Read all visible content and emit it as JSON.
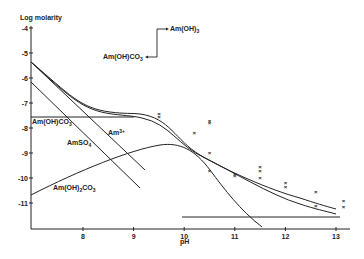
{
  "chart_data": {
    "type": "line",
    "title": "",
    "xlabel": "pH",
    "ylabel": "Log molarity",
    "xlim": [
      7.0,
      13.3
    ],
    "ylim": [
      -12.0,
      -4.0
    ],
    "xticks": [
      "8",
      "9",
      "10",
      "11",
      "12",
      "13"
    ],
    "yticks": [
      "-4",
      "-5",
      "-6",
      "-7",
      "-8",
      "-9",
      "-10",
      "-11"
    ],
    "grid": false,
    "legend": "none (inline labels)",
    "series": [
      {
        "name": "Total solubility (upper)",
        "x": [
          7.0,
          7.5,
          8.0,
          8.5,
          9.0,
          9.5,
          10.0,
          10.5,
          11.0,
          11.5,
          12.0,
          12.5,
          13.0
        ],
        "y": [
          -5.4,
          -6.2,
          -7.0,
          -7.4,
          -7.55,
          -7.8,
          -8.5,
          -9.1,
          -9.6,
          -10.0,
          -10.4,
          -10.7,
          -11.05
        ]
      },
      {
        "name": "Total solubility (lower)",
        "x": [
          7.0,
          7.5,
          8.0,
          8.5,
          9.0,
          9.5,
          10.0,
          10.5,
          11.0,
          11.5,
          12.0,
          12.5,
          13.0
        ],
        "y": [
          -5.4,
          -6.25,
          -7.05,
          -7.5,
          -7.6,
          -7.95,
          -8.7,
          -9.3,
          -9.7,
          -10.05,
          -10.5,
          -10.85,
          -11.2
        ]
      },
      {
        "name": "Am(OH)CO3 (solid, horizontal)",
        "x": [
          7.0,
          9.0
        ],
        "y": [
          -7.55,
          -7.55
        ]
      },
      {
        "name": "Am3+",
        "x": [
          7.0,
          9.0
        ],
        "y": [
          -5.4,
          -9.6
        ]
      },
      {
        "name": "AmSO4+",
        "x": [
          7.0,
          9.0
        ],
        "y": [
          -6.2,
          -10.3
        ]
      },
      {
        "name": "Am(OH)2CO3-",
        "x": [
          7.0,
          8.0,
          9.0,
          9.5,
          10.0,
          10.5,
          11.0,
          11.5
        ],
        "y": [
          -10.6,
          -9.6,
          -8.75,
          -8.5,
          -8.7,
          -9.6,
          -10.7,
          -12.0
        ]
      },
      {
        "name": "Am(OH)3 (solid, horizontal)",
        "x": [
          10.0,
          13.0
        ],
        "y": [
          -11.5,
          -11.5
        ]
      }
    ],
    "scatter_points": {
      "marker": "x",
      "x": [
        9.5,
        9.5,
        10.2,
        10.5,
        10.5,
        10.5,
        10.5,
        11.0,
        11.0,
        11.5,
        11.5,
        11.5,
        12.0,
        12.0,
        12.6,
        12.6,
        13.15,
        13.15
      ],
      "y": [
        -7.45,
        -7.55,
        -8.2,
        -7.7,
        -7.8,
        -9.0,
        -9.7,
        -9.85,
        -9.9,
        -9.55,
        -9.7,
        -10.0,
        -10.2,
        -10.35,
        -10.55,
        -11.1,
        -10.9,
        -11.15
      ]
    },
    "annotations": [
      {
        "text": "Am(OH)3",
        "note": "arrow label, top"
      },
      {
        "text": "Am(OH)CO3",
        "note": "arrow label, top"
      },
      {
        "text": "Am(OH)CO3",
        "note": "horizontal line label"
      },
      {
        "text": "Am3+"
      },
      {
        "text": "AmSO4+"
      },
      {
        "text": "Am(OH)2CO3-"
      }
    ]
  },
  "labels": {
    "ylabel": "Log molarity",
    "xlabel": "pH",
    "arrow_top": "Am(OH)",
    "arrow_top_sub": "3",
    "arrow_mid": "Am(OH)CO",
    "arrow_mid_sub": "3",
    "line_amohco3": "Am(OH)CO",
    "line_amohco3_sub": "3",
    "am3": "Am",
    "am3_sup": "3+",
    "amso4": "AmSO",
    "amso4_sub": "4",
    "amso4_sup": "+",
    "amoh2co3_a": "Am(OH)",
    "amoh2co3_sub1": "2",
    "amoh2co3_b": "CO",
    "amoh2co3_sub2": "3",
    "amoh2co3_sup": "−"
  }
}
